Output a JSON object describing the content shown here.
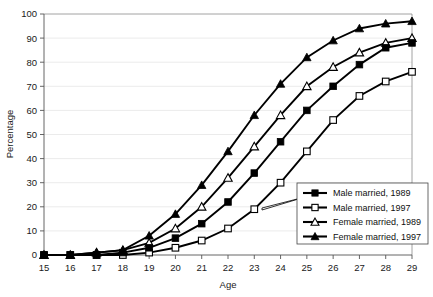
{
  "chart_data": {
    "type": "line",
    "title": "",
    "xlabel": "Age",
    "ylabel": "Percentage",
    "x": [
      15,
      16,
      17,
      18,
      19,
      20,
      21,
      22,
      23,
      24,
      25,
      26,
      27,
      28,
      29
    ],
    "xlim": [
      15,
      29
    ],
    "ylim": [
      0,
      100
    ],
    "xticks": [
      "15",
      "16",
      "17",
      "18",
      "19",
      "20",
      "21",
      "22",
      "23",
      "24",
      "25",
      "26",
      "27",
      "28",
      "29"
    ],
    "yticks": [
      "0",
      "10",
      "20",
      "30",
      "40",
      "50",
      "60",
      "70",
      "80",
      "90",
      "100"
    ],
    "grid": true,
    "legend_position": "bottom-right",
    "series": [
      {
        "name": "Male married, 1989",
        "marker": "filled-square",
        "values": [
          0,
          0,
          0,
          1,
          3,
          7,
          13,
          22,
          34,
          47,
          60,
          70,
          79,
          86,
          88
        ]
      },
      {
        "name": "Male married, 1997",
        "marker": "open-square",
        "values": [
          0,
          0,
          0,
          0,
          1,
          3,
          6,
          11,
          19,
          30,
          43,
          56,
          66,
          72,
          76
        ]
      },
      {
        "name": "Female married, 1989",
        "marker": "open-triangle",
        "values": [
          0,
          0,
          1,
          2,
          5,
          11,
          20,
          32,
          45,
          58,
          70,
          78,
          84,
          88,
          90
        ]
      },
      {
        "name": "Female married, 1997",
        "marker": "filled-triangle",
        "values": [
          0,
          0,
          1,
          2,
          8,
          17,
          29,
          43,
          58,
          71,
          82,
          89,
          94,
          96,
          97
        ]
      }
    ]
  },
  "legend": {
    "items": [
      {
        "label": "Male married, 1989"
      },
      {
        "label": "Male married, 1997"
      },
      {
        "label": "Female married, 1989"
      },
      {
        "label": "Female married, 1997"
      }
    ]
  }
}
